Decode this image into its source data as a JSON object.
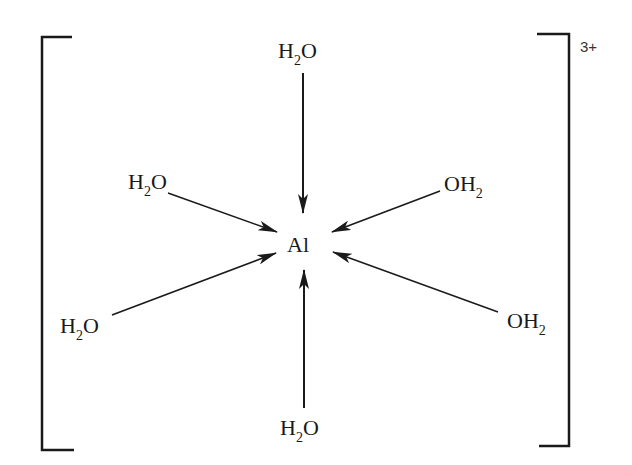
{
  "diagram": {
    "center_atom": "Al",
    "charge": "3+",
    "ligands": [
      {
        "position": "top",
        "main": "H",
        "sub": "2",
        "tail": "O"
      },
      {
        "position": "upper-left",
        "main": "H",
        "sub": "2",
        "tail": "O"
      },
      {
        "position": "upper-right",
        "main": "OH",
        "sub": "2",
        "tail": ""
      },
      {
        "position": "lower-left",
        "main": "H",
        "sub": "2",
        "tail": "O"
      },
      {
        "position": "lower-right",
        "main": "OH",
        "sub": "2",
        "tail": ""
      },
      {
        "position": "bottom",
        "main": "H",
        "sub": "2",
        "tail": "O"
      }
    ],
    "colors": {
      "line": "#1a1a1a",
      "background": "#ffffff"
    }
  }
}
